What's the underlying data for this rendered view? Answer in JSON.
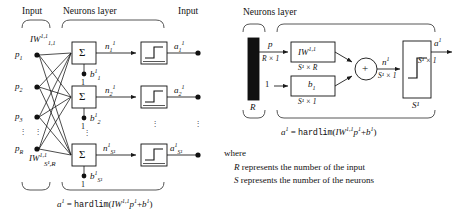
{
  "figure": {
    "ink_color": "#1a1a1a",
    "background": "#ffffff"
  },
  "left_panel": {
    "headers": {
      "input": "Input",
      "neurons_layer": "Neurons layer",
      "output_input": "Input"
    },
    "inputs": [
      "p",
      "p",
      "p",
      "p"
    ],
    "input_subscripts": [
      "1",
      "2",
      "3",
      "R"
    ],
    "input_ellipsis": "⋮",
    "weight_label_top": {
      "base": "IW",
      "superscript": "1,1",
      "subscript": "1,1"
    },
    "weight_label_bottom": {
      "base": "IW",
      "superscript": "1,1",
      "subscript": "S¹,R"
    },
    "sum_symbol": "Σ",
    "neurons": [
      {
        "net_base": "n",
        "net_sub": "1",
        "net_sup": "1",
        "bias_base": "b",
        "bias_sup": "1",
        "bias_sub": "1",
        "bias_input": "1",
        "out_base": "a",
        "out_sub": "1",
        "out_sup": "1"
      },
      {
        "net_base": "n",
        "net_sub": "2",
        "net_sup": "1",
        "bias_base": "b",
        "bias_sup": "1",
        "bias_sub": "2",
        "bias_input": "1",
        "out_base": "a",
        "out_sub": "2",
        "out_sup": "1"
      },
      {
        "net_base": "n",
        "net_sub": "S¹",
        "net_sup": "1",
        "bias_base": "b",
        "bias_sup": "1",
        "bias_sub": "S¹",
        "bias_input": "1",
        "out_base": "a",
        "out_sub": "S¹",
        "out_sup": "1"
      }
    ],
    "row_ellipsis": "⋮",
    "equation": {
      "lhs_base": "a",
      "lhs_sup": "1",
      "eq": "=",
      "fn": "hardlim",
      "open": "(",
      "w_base": "IW",
      "w_sup": "1,1",
      "p_base": "p",
      "p_sup": "1",
      "plus": "+",
      "b_base": "b",
      "b_sup": "1",
      "close": ")"
    }
  },
  "right_panel": {
    "headers": {
      "neurons_layer": "Neurons layer"
    },
    "input_block": {
      "label": "R",
      "signal": "p",
      "dims": "R × 1"
    },
    "bias_input": "1",
    "weight_block": {
      "base": "IW",
      "superscript": "1,1",
      "dims": "S¹ × R"
    },
    "bias_block": {
      "base": "b",
      "subscript": "1",
      "dims": "S¹ × 1"
    },
    "sum_symbol": "+",
    "net": {
      "base": "n",
      "superscript": "1",
      "dims": "S¹ × 1"
    },
    "transfer_block": {
      "label": "S¹"
    },
    "output": {
      "base": "a",
      "superscript": "1",
      "dims": "S¹ × 1"
    },
    "equation": {
      "lhs_base": "a",
      "lhs_sup": "1",
      "eq": "=",
      "fn": "hardlim",
      "open": "(",
      "w_base": "IW",
      "w_sup": "1,1",
      "p_base": "p",
      "p_sup": "1",
      "plus": "+",
      "b_base": "b",
      "b_sup": "1",
      "close": ")"
    },
    "legend": {
      "where": "where",
      "line1_sym": "R",
      "line1_text": "represents the number of the input",
      "line2_sym": "S",
      "line2_text": "represents the number of the neurons"
    }
  }
}
